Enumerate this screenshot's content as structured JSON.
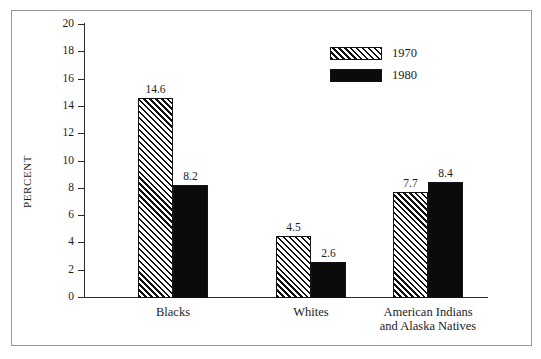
{
  "chart_data": {
    "type": "bar",
    "title": "",
    "subtitle": "",
    "xlabel": "",
    "ylabel": "PERCENT",
    "ylim": [
      0,
      20
    ],
    "yticks": [
      0,
      2,
      4,
      6,
      8,
      10,
      12,
      14,
      16,
      18,
      20
    ],
    "ytick_labels": [
      "0",
      "2",
      "4",
      "6",
      "8",
      "10",
      "12",
      "14",
      "16",
      "18",
      "20"
    ],
    "grid": false,
    "legend_position": "upper-right-inside",
    "categories": [
      "Blacks",
      "Whites",
      "American Indians\nand Alaska Natives"
    ],
    "series": [
      {
        "name": "1970",
        "fill": "diagonal-hatch",
        "values": [
          14.6,
          4.5,
          7.7
        ],
        "labels": [
          "14.6",
          "4.5",
          "7.7"
        ]
      },
      {
        "name": "1980",
        "fill": "solid-black",
        "values": [
          8.2,
          2.6,
          8.4
        ],
        "labels": [
          "8.2",
          "2.6",
          "8.4"
        ]
      }
    ]
  },
  "axis": {
    "y_title": "PERCENT"
  },
  "legend": {
    "entries": [
      {
        "label": "1970",
        "fill": "diagonal-hatch"
      },
      {
        "label": "1980",
        "fill": "solid-black"
      }
    ]
  },
  "colors": {
    "series_1970": "#ffffff",
    "series_1980": "#0b0b0b",
    "outline": "#141414",
    "axis": "#2b2b2b",
    "frame": "#9a9a9a",
    "text": "#1c1c1c",
    "background": "#ffffff"
  },
  "top_edge_text": ""
}
